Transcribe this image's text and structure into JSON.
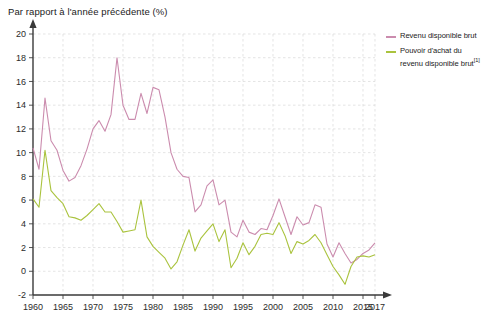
{
  "chart_data": {
    "type": "line",
    "title": "Par rapport à l'année précédente (%)",
    "xlabel": "",
    "ylabel": "",
    "xlim": [
      1960,
      2017
    ],
    "ylim": [
      -2,
      20
    ],
    "ytick_step": 2,
    "xtick_step": 5,
    "grid": true,
    "legend_position": "right",
    "yticks": [
      "20",
      "18",
      "16",
      "14",
      "12",
      "10",
      "8",
      "6",
      "4",
      "2",
      "0",
      "-2"
    ],
    "xticks": [
      "1960",
      "1965",
      "1970",
      "1975",
      "1980",
      "1985",
      "1990",
      "1995",
      "2000",
      "2005",
      "2010",
      "2017"
    ],
    "x": [
      1960,
      1961,
      1962,
      1963,
      1964,
      1965,
      1966,
      1967,
      1968,
      1969,
      1970,
      1971,
      1972,
      1973,
      1974,
      1975,
      1976,
      1977,
      1978,
      1979,
      1980,
      1981,
      1982,
      1983,
      1984,
      1985,
      1986,
      1987,
      1988,
      1989,
      1990,
      1991,
      1992,
      1993,
      1994,
      1995,
      1996,
      1997,
      1998,
      1999,
      2000,
      2001,
      2002,
      2003,
      2004,
      2005,
      2006,
      2007,
      2008,
      2009,
      2010,
      2011,
      2012,
      2013,
      2014,
      2015,
      2016,
      2017
    ],
    "series": [
      {
        "name": "Revenu disponible brut",
        "color": "#cb8cae",
        "values": [
          10.4,
          8.6,
          14.6,
          11.0,
          10.2,
          8.5,
          7.6,
          7.9,
          8.9,
          10.3,
          12.0,
          12.7,
          11.8,
          13.2,
          18.0,
          14.0,
          12.8,
          12.8,
          15.0,
          13.3,
          15.5,
          15.3,
          13.0,
          10.0,
          8.6,
          8.0,
          7.9,
          5.0,
          5.6,
          7.2,
          7.7,
          5.6,
          6.0,
          3.3,
          2.9,
          4.3,
          3.3,
          3.1,
          3.6,
          3.5,
          4.7,
          6.1,
          4.6,
          3.1,
          4.6,
          3.9,
          4.1,
          5.6,
          5.4,
          2.3,
          1.2,
          2.4,
          1.5,
          0.7,
          1.0,
          1.5,
          1.8,
          2.4
        ]
      },
      {
        "name": "Pouvoir d'achat du revenu disponible brut[1]",
        "color": "#aac33e",
        "values": [
          6.1,
          5.4,
          10.2,
          6.8,
          6.2,
          5.7,
          4.6,
          4.5,
          4.3,
          4.7,
          5.2,
          5.7,
          5.0,
          5.0,
          4.2,
          3.3,
          3.4,
          3.5,
          6.0,
          2.9,
          2.1,
          1.6,
          1.1,
          0.2,
          0.8,
          2.2,
          3.5,
          1.7,
          2.8,
          3.4,
          4.0,
          2.5,
          3.5,
          0.3,
          1.1,
          2.4,
          1.4,
          2.1,
          3.1,
          3.2,
          3.1,
          4.1,
          3.0,
          1.5,
          2.5,
          2.3,
          2.6,
          3.1,
          2.4,
          1.4,
          0.4,
          -0.3,
          -1.1,
          0.4,
          1.2,
          1.3,
          1.2,
          1.4
        ]
      }
    ]
  },
  "axis": {
    "title": "Par rapport à l'année précédente (%)"
  },
  "legend": {
    "items": [
      {
        "label": "Revenu disponible brut",
        "footnote": "",
        "color": "#cb8cae"
      },
      {
        "label": "Pouvoir d'achat du revenu disponible brut",
        "footnote": "[1]",
        "color": "#aac33e"
      }
    ]
  }
}
